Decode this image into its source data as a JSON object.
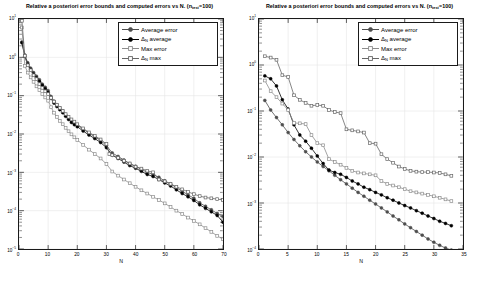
{
  "figure": {
    "width": 479,
    "height": 284,
    "background": "#ffffff",
    "panels": [
      "left",
      "right"
    ]
  },
  "colors": {
    "average_error": "#4d4d4d",
    "delta_n_average": "#000000",
    "max_error": "#8c8c8c",
    "delta_n_max": "#666666",
    "axis": "#1a1a1a",
    "grid": "#e6e6e6"
  },
  "left_panel": {
    "title_main": "Relative a posteriori error bounds and computed errors vs N.  (n",
    "title_sub": "test",
    "title_tail": "=100)",
    "xlabel": "N",
    "xticks": [
      "0",
      "10",
      "20",
      "30",
      "40",
      "50",
      "60",
      "70"
    ],
    "yticks": [
      "10",
      "10",
      "10",
      "10",
      "10",
      "10",
      "10"
    ],
    "yexps": [
      "1",
      "0",
      "-1",
      "-2",
      "-3",
      "-4",
      "-5"
    ],
    "legend": [
      {
        "label": "Average error",
        "marker": "circle-filled",
        "color": "#4d4d4d"
      },
      {
        "label": "Δ",
        "sub": "N",
        "tail": " average",
        "marker": "circle-filled",
        "color": "#000000"
      },
      {
        "label": "Max error",
        "marker": "square-open",
        "color": "#8c8c8c"
      },
      {
        "label": "Δ",
        "sub": "N",
        "tail": " max",
        "marker": "square-open",
        "color": "#666666"
      }
    ]
  },
  "right_panel": {
    "title_main": "Relative a posteriori error bounds and computed errors vs N.  (n",
    "title_sub": "test",
    "title_tail": "=100)",
    "xlabel": "N",
    "xticks": [
      "0",
      "5",
      "10",
      "15",
      "20",
      "25",
      "30",
      "35"
    ],
    "yticks": [
      "10",
      "10",
      "10",
      "10",
      "10",
      "10"
    ],
    "yexps": [
      "1",
      "0",
      "-1",
      "-2",
      "-3",
      "-4"
    ],
    "legend": [
      {
        "label": "Average error",
        "marker": "circle-filled",
        "color": "#4d4d4d"
      },
      {
        "label": "Δ",
        "sub": "N",
        "tail": " average",
        "marker": "circle-filled",
        "color": "#000000"
      },
      {
        "label": "Max error",
        "marker": "square-open",
        "color": "#8c8c8c"
      },
      {
        "label": "Δ",
        "sub": "N",
        "tail": " max",
        "marker": "square-open",
        "color": "#666666"
      }
    ]
  },
  "chart_data": [
    {
      "type": "line",
      "panel": "left",
      "title": "Relative a posteriori error bounds and computed errors vs N.  (n_test=100)",
      "xlabel": "N",
      "ylabel": "",
      "yscale": "log",
      "xlim": [
        0,
        70
      ],
      "ylim": [
        1e-05,
        10
      ],
      "grid": true,
      "legend_position": "top-right",
      "series": [
        {
          "name": "Average error",
          "color": "#4d4d4d",
          "marker": "circle-filled",
          "x": [
            1,
            2,
            3,
            4,
            5,
            6,
            7,
            8,
            9,
            10,
            11,
            12,
            13,
            14,
            15,
            16,
            17,
            18,
            19,
            20,
            22,
            24,
            26,
            28,
            30,
            32,
            34,
            36,
            38,
            40,
            42,
            44,
            46,
            48,
            50,
            52,
            54,
            56,
            58,
            60,
            62,
            64,
            66,
            68,
            70
          ],
          "y": [
            2.5,
            1.15,
            0.72,
            0.52,
            0.4,
            0.32,
            0.26,
            0.2,
            0.165,
            0.135,
            0.095,
            0.072,
            0.058,
            0.048,
            0.04,
            0.032,
            0.026,
            0.022,
            0.019,
            0.017,
            0.0135,
            0.0105,
            0.0085,
            0.0068,
            0.005,
            0.0032,
            0.0026,
            0.0021,
            0.0017,
            0.00145,
            0.0012,
            0.001,
            0.00088,
            0.00074,
            0.0006,
            0.0005,
            0.0004,
            0.00032,
            0.00026,
            0.00021,
            0.00016,
            0.00013,
            0.000105,
            8.5e-05,
            7e-05
          ]
        },
        {
          "name": "Δ_N average",
          "color": "#000000",
          "marker": "circle-filled",
          "x": [
            1,
            2,
            3,
            4,
            5,
            6,
            7,
            8,
            9,
            10,
            11,
            12,
            13,
            14,
            15,
            16,
            17,
            18,
            19,
            20,
            22,
            24,
            26,
            28,
            30,
            32,
            34,
            36,
            38,
            40,
            42,
            44,
            46,
            48,
            50,
            52,
            54,
            56,
            58,
            60,
            62,
            64,
            66,
            68,
            70
          ],
          "y": [
            2.4,
            1.05,
            0.66,
            0.48,
            0.36,
            0.29,
            0.235,
            0.185,
            0.15,
            0.12,
            0.085,
            0.064,
            0.052,
            0.043,
            0.036,
            0.029,
            0.024,
            0.02,
            0.0175,
            0.0155,
            0.012,
            0.0094,
            0.0076,
            0.006,
            0.0044,
            0.0028,
            0.0023,
            0.00185,
            0.0015,
            0.00128,
            0.00106,
            0.00088,
            0.00078,
            0.00065,
            0.00053,
            0.00044,
            0.00035,
            0.00028,
            0.00023,
            0.000185,
            0.000142,
            0.000115,
            9.3e-05,
            7.5e-05,
            5e-05
          ]
        },
        {
          "name": "Max error",
          "color": "#8c8c8c",
          "marker": "square-open",
          "x": [
            1,
            2,
            3,
            4,
            5,
            6,
            7,
            8,
            9,
            10,
            11,
            12,
            13,
            14,
            15,
            16,
            17,
            18,
            19,
            20,
            22,
            24,
            26,
            28,
            30,
            32,
            34,
            36,
            38,
            40,
            42,
            44,
            46,
            48,
            50,
            52,
            54,
            56,
            58,
            60,
            62,
            64,
            66,
            68,
            70
          ],
          "y": [
            6.0,
            0.6,
            0.4,
            0.3,
            0.23,
            0.175,
            0.14,
            0.11,
            0.09,
            0.074,
            0.05,
            0.036,
            0.028,
            0.022,
            0.018,
            0.0145,
            0.0118,
            0.0098,
            0.0082,
            0.007,
            0.0052,
            0.0039,
            0.003,
            0.0023,
            0.00165,
            0.00105,
            0.00082,
            0.00065,
            0.00052,
            0.00042,
            0.00034,
            0.00028,
            0.00023,
            0.00019,
            0.000155,
            0.000125,
            0.0001,
            8.2e-05,
            6.6e-05,
            5.4e-05,
            4.4e-05,
            3.5e-05,
            2.8e-05,
            2.2e-05,
            1.8e-05
          ]
        },
        {
          "name": "Δ_N max",
          "color": "#666666",
          "marker": "square-open",
          "x": [
            1,
            2,
            3,
            4,
            5,
            6,
            7,
            8,
            9,
            10,
            11,
            12,
            13,
            14,
            15,
            16,
            17,
            18,
            19,
            20,
            22,
            24,
            26,
            28,
            30,
            31,
            32,
            34,
            36,
            38,
            40,
            42,
            44,
            46,
            48,
            50,
            52,
            54,
            56,
            58,
            60,
            62,
            64,
            66,
            68,
            70
          ],
          "y": [
            9.0,
            1.1,
            0.62,
            0.46,
            0.34,
            0.27,
            0.2,
            0.16,
            0.13,
            0.11,
            0.088,
            0.07,
            0.058,
            0.048,
            0.04,
            0.033,
            0.028,
            0.024,
            0.021,
            0.018,
            0.014,
            0.011,
            0.009,
            0.0072,
            0.0055,
            0.003,
            0.0028,
            0.0024,
            0.002,
            0.0017,
            0.0014,
            0.00125,
            0.0011,
            0.001,
            0.00065,
            0.00058,
            0.0005,
            0.00042,
            0.00036,
            0.00031,
            0.00027,
            0.00024,
            0.00022,
            0.00021,
            0.0002,
            0.00019
          ]
        }
      ]
    },
    {
      "type": "line",
      "panel": "right",
      "title": "Relative a posteriori error bounds and computed errors vs N.  (n_test=100)",
      "xlabel": "N",
      "ylabel": "",
      "yscale": "log",
      "xlim": [
        0,
        35
      ],
      "ylim": [
        0.0001,
        10
      ],
      "grid": true,
      "legend_position": "top-right",
      "series": [
        {
          "name": "Average error",
          "color": "#4d4d4d",
          "marker": "circle-filled",
          "x": [
            1,
            2,
            3,
            4,
            5,
            6,
            7,
            8,
            9,
            10,
            11,
            12,
            13,
            14,
            15,
            16,
            17,
            18,
            19,
            20,
            21,
            22,
            23,
            24,
            25,
            26,
            27,
            28,
            29,
            30,
            31,
            32,
            33
          ],
          "y": [
            0.17,
            0.105,
            0.072,
            0.05,
            0.034,
            0.024,
            0.0175,
            0.013,
            0.01,
            0.0078,
            0.0062,
            0.005,
            0.004,
            0.0032,
            0.0026,
            0.0021,
            0.0017,
            0.0014,
            0.00115,
            0.00095,
            0.00078,
            0.00064,
            0.00052,
            0.00043,
            0.00035,
            0.00029,
            0.00024,
            0.0002,
            0.000165,
            0.00014,
            0.00012,
            0.000105,
            9.5e-05
          ]
        },
        {
          "name": "Δ_N average",
          "color": "#000000",
          "marker": "circle-filled",
          "x": [
            1,
            2,
            3,
            4,
            5,
            6,
            7,
            8,
            9,
            10,
            11,
            12,
            13,
            14,
            15,
            16,
            17,
            18,
            19,
            20,
            21,
            22,
            23,
            24,
            25,
            26,
            27,
            28,
            29,
            30,
            31,
            32,
            33
          ],
          "y": [
            0.58,
            0.5,
            0.35,
            0.175,
            0.11,
            0.05,
            0.03,
            0.022,
            0.0155,
            0.0105,
            0.0072,
            0.0052,
            0.0046,
            0.0042,
            0.0036,
            0.003,
            0.0026,
            0.0022,
            0.00195,
            0.0017,
            0.0015,
            0.0013,
            0.00115,
            0.001,
            0.00088,
            0.00078,
            0.00068,
            0.0006,
            0.00052,
            0.00046,
            0.0004,
            0.00036,
            0.00032
          ]
        },
        {
          "name": "Max error",
          "color": "#8c8c8c",
          "marker": "square-open",
          "x": [
            1,
            2,
            3,
            4,
            5,
            6,
            7,
            8,
            9,
            10,
            11,
            12,
            13,
            14,
            15,
            16,
            17,
            18,
            19,
            20,
            21,
            22,
            23,
            24,
            25,
            26,
            27,
            28,
            29,
            30,
            31,
            32,
            33
          ],
          "y": [
            0.46,
            0.27,
            0.2,
            0.145,
            0.105,
            0.055,
            0.054,
            0.052,
            0.03,
            0.02,
            0.018,
            0.009,
            0.0078,
            0.0068,
            0.0058,
            0.005,
            0.0046,
            0.0044,
            0.0042,
            0.004,
            0.003,
            0.0026,
            0.0024,
            0.0022,
            0.002,
            0.0018,
            0.0017,
            0.0016,
            0.0015,
            0.0014,
            0.0013,
            0.0012,
            0.0011
          ]
        },
        {
          "name": "Δ_N max",
          "color": "#666666",
          "marker": "square-open",
          "x": [
            1,
            2,
            3,
            4,
            5,
            6,
            7,
            8,
            9,
            10,
            11,
            12,
            13,
            14,
            15,
            16,
            17,
            18,
            19,
            20,
            21,
            22,
            23,
            24,
            25,
            26,
            27,
            28,
            29,
            30,
            31,
            32,
            33
          ],
          "y": [
            1.55,
            1.45,
            1.3,
            0.6,
            0.55,
            0.22,
            0.175,
            0.15,
            0.13,
            0.135,
            0.13,
            0.105,
            0.095,
            0.09,
            0.04,
            0.038,
            0.036,
            0.034,
            0.02,
            0.0195,
            0.0115,
            0.009,
            0.0075,
            0.0062,
            0.0055,
            0.005,
            0.0048,
            0.0047,
            0.0047,
            0.0046,
            0.0045,
            0.0042,
            0.0039
          ]
        }
      ]
    }
  ]
}
